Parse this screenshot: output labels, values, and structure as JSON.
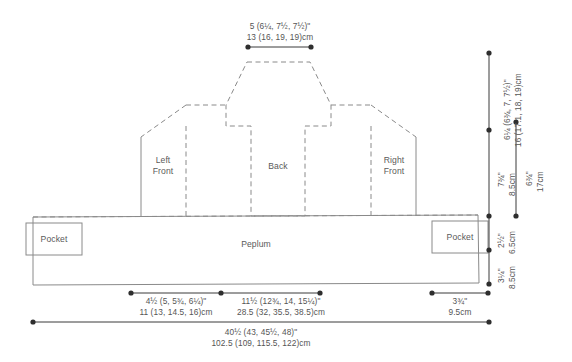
{
  "diagram": {
    "type": "sewing-pattern-schematic",
    "stroke_color": "#808080",
    "text_color": "#555555"
  },
  "panels": [
    {
      "id": "left-front",
      "label_line1": "Left",
      "label_line2": "Front"
    },
    {
      "id": "back",
      "label_line1": "Back",
      "label_line2": ""
    },
    {
      "id": "right-front",
      "label_line1": "Right",
      "label_line2": "Front"
    },
    {
      "id": "peplum",
      "label_line1": "Peplum",
      "label_line2": ""
    },
    {
      "id": "pocket-left",
      "label_line1": "Pocket",
      "label_line2": ""
    },
    {
      "id": "pocket-right",
      "label_line1": "Pocket",
      "label_line2": ""
    }
  ],
  "measurements": {
    "top_shoulder": {
      "name": "back-neck-width",
      "inches": "5 (6¼, 7½, 7½)\"",
      "cm": "13 (16, 19, 19)cm"
    },
    "right_upper": {
      "name": "bodice-upper-height",
      "inches": "6¼ (6¾, 7, 7½)\"",
      "cm": "16 (17.1, 18, 19)cm"
    },
    "right_mid_inner": {
      "name": "armhole-depth",
      "inches": "7¾\"",
      "cm": "8.5cm"
    },
    "right_mid_outer": {
      "name": "bodice-side-height",
      "inches": "6¾\"",
      "cm": "17cm"
    },
    "right_lower_upper": {
      "name": "peplum-upper-height",
      "inches": "2½\"",
      "cm": "6.5cm"
    },
    "right_lower_lower": {
      "name": "peplum-lower-height",
      "inches": "3¼\"",
      "cm": "8.5cm"
    },
    "bottom_left_segment": {
      "name": "front-panel-width",
      "inches": "4½ (5, 5¾, 6¼)\"",
      "cm": "11 (13, 14.5, 16)cm"
    },
    "bottom_mid_segment": {
      "name": "back-panel-width",
      "inches": "11½ (12¾, 14, 15¼)\"",
      "cm": "28.5 (32, 35.5, 38.5)cm"
    },
    "bottom_right_segment": {
      "name": "pocket-width",
      "inches": "3¾\"",
      "cm": "9.5cm"
    },
    "bottom_total": {
      "name": "total-hem-circumference",
      "inches": "40½ (43, 45½, 48)\"",
      "cm": "102.5 (109, 115.5, 122)cm"
    }
  }
}
